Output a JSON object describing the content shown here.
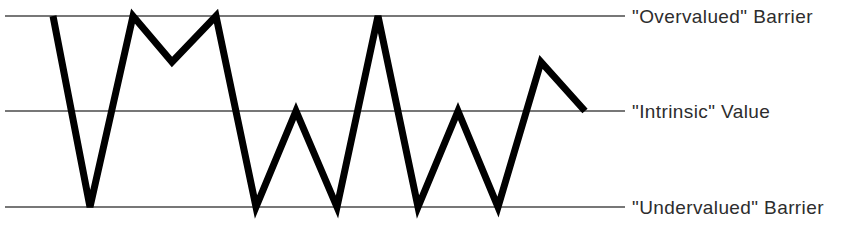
{
  "chart_data": {
    "type": "line",
    "title": "",
    "subtitle": "",
    "xlabel": "",
    "ylabel": "",
    "grid": false,
    "legend_position": "right-inline",
    "axis_range_note": "Vertical axis is qualitative: three unlabeled reference levels.",
    "levels": [
      {
        "key": "overvalued",
        "label": "\"Overvalued\" Barrier",
        "value": 2,
        "y_px": 16
      },
      {
        "key": "intrinsic",
        "label": "\"Intrinsic\" Value",
        "value": 1,
        "y_px": 111
      },
      {
        "key": "undervalued",
        "label": "\"Undervalued\" Barrier",
        "value": 0,
        "y_px": 207
      }
    ],
    "reference_lines": {
      "x_start_px": 5,
      "x_end_px": 625,
      "color": "#4a4a4a",
      "width_px": 1.6
    },
    "series": [
      {
        "name": "Market Price",
        "color": "#000000",
        "stroke_width_px": 7,
        "x": [
          53,
          90,
          133,
          172,
          216,
          256,
          296,
          337,
          378,
          418,
          458,
          498,
          541,
          585
        ],
        "values": [
          2,
          0,
          2,
          1.52,
          2,
          0,
          1,
          0,
          2,
          0,
          1,
          0,
          1.52,
          1
        ],
        "y_px": [
          16,
          207,
          16,
          62,
          16,
          207,
          111,
          207,
          16,
          207,
          111,
          207,
          62,
          111
        ],
        "points": [
          {
            "x": 53,
            "y": 16,
            "level": "overvalued"
          },
          {
            "x": 90,
            "y": 207,
            "level": "undervalued"
          },
          {
            "x": 133,
            "y": 16,
            "level": "overvalued"
          },
          {
            "x": 172,
            "y": 62,
            "level": "between"
          },
          {
            "x": 216,
            "y": 16,
            "level": "overvalued"
          },
          {
            "x": 256,
            "y": 207,
            "level": "undervalued"
          },
          {
            "x": 296,
            "y": 111,
            "level": "intrinsic"
          },
          {
            "x": 337,
            "y": 207,
            "level": "undervalued"
          },
          {
            "x": 378,
            "y": 16,
            "level": "overvalued"
          },
          {
            "x": 418,
            "y": 207,
            "level": "undervalued"
          },
          {
            "x": 458,
            "y": 111,
            "level": "intrinsic"
          },
          {
            "x": 498,
            "y": 207,
            "level": "undervalued"
          },
          {
            "x": 541,
            "y": 62,
            "level": "between"
          },
          {
            "x": 585,
            "y": 111,
            "level": "intrinsic"
          }
        ]
      }
    ]
  },
  "figure": {
    "background": "#ffffff",
    "line_color": "#000000",
    "rule_color": "#4a4a4a",
    "text_color": "#2d2d2d"
  }
}
